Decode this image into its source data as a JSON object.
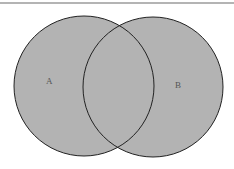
{
  "diagram": {
    "type": "venn",
    "fill_color": "#b3b3b3",
    "stroke_color": "#222222",
    "sets": [
      {
        "label": "A",
        "cx": 84,
        "cy": 86,
        "r": 70,
        "label_x": 46,
        "label_y": 84
      },
      {
        "label": "B",
        "cx": 153,
        "cy": 87,
        "r": 70,
        "label_x": 175,
        "label_y": 88
      }
    ]
  }
}
